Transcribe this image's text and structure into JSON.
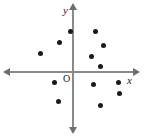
{
  "chart_data": {
    "type": "scatter",
    "title": "",
    "subtitle": "",
    "xlabel": "x",
    "ylabel": "y",
    "origin_label": "O",
    "grid": false,
    "legend": null,
    "axes": {
      "x_axis_y_px": 72,
      "y_axis_x_px": 73,
      "x_range_px": [
        6,
        137
      ],
      "y_range_px": [
        6,
        131
      ],
      "arrows": [
        "left",
        "right",
        "up",
        "down"
      ],
      "axis_color": "#8a8a8a",
      "point_color": "#1a1a1a"
    },
    "point_count": 13,
    "points": [
      {
        "quadrant": "II",
        "px": 70,
        "py": 31
      },
      {
        "quadrant": "II",
        "px": 59,
        "py": 42
      },
      {
        "quadrant": "II",
        "px": 40,
        "py": 53
      },
      {
        "quadrant": "I",
        "px": 95,
        "py": 31
      },
      {
        "quadrant": "I",
        "px": 103,
        "py": 45
      },
      {
        "quadrant": "I",
        "px": 91,
        "py": 56
      },
      {
        "quadrant": "I",
        "px": 100,
        "py": 66
      },
      {
        "quadrant": "III",
        "px": 54,
        "py": 82
      },
      {
        "quadrant": "III",
        "px": 58,
        "py": 101
      },
      {
        "quadrant": "IV",
        "px": 93,
        "py": 84
      },
      {
        "quadrant": "IV",
        "px": 118,
        "py": 82
      },
      {
        "quadrant": "IV",
        "px": 119,
        "py": 93
      },
      {
        "quadrant": "IV",
        "px": 100,
        "py": 105
      }
    ]
  }
}
